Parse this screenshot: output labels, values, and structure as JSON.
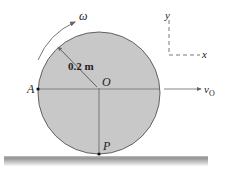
{
  "diagram": {
    "radius_label": "0.2 m",
    "center_label": "O",
    "point_a_label": "A",
    "point_p_label": "P",
    "omega_label": "ω",
    "velocity_label": "v",
    "velocity_subscript": "O",
    "axis_y_label": "y",
    "axis_x_label": "x"
  },
  "colors": {
    "disk_fill": "#c8c8c8",
    "disk_stroke": "#555555",
    "ground": "#888888"
  }
}
